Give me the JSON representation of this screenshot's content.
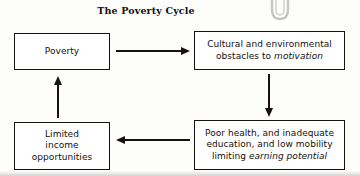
{
  "figure": {
    "title": "The Poverty Cycle",
    "type": "cycle-flow-diagram"
  },
  "nodes": {
    "poverty": {
      "label": "Poverty"
    },
    "obstacles": {
      "line1": "Cultural and environmental",
      "line2_plain": "obstacles to ",
      "line2_italic": "motivation"
    },
    "limited_income": {
      "line1": "Limited",
      "line2": "income",
      "line3": "opportunities"
    },
    "poor_health": {
      "line1": "Poor health, and inadequate",
      "line2": "education, and low mobility",
      "line3_plain": "limiting ",
      "line3_italic": "earning potential"
    }
  },
  "arrows": [
    {
      "name": "poverty-to-obstacles",
      "direction": "right"
    },
    {
      "name": "obstacles-to-poor-health",
      "direction": "down"
    },
    {
      "name": "poor-health-to-limited-income",
      "direction": "left"
    },
    {
      "name": "limited-income-to-poverty",
      "direction": "up"
    }
  ],
  "artifacts": {
    "paperclip": "paperclip-icon"
  },
  "colors": {
    "ink": "#17120f",
    "paper": "#fdfdfc"
  }
}
